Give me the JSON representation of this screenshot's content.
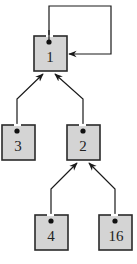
{
  "diagram": {
    "type": "union-find-tree",
    "colors": {
      "node_fill": "#d4d4d4",
      "node_stroke": "#2a2a2a",
      "edge": "#1a1a1a"
    },
    "nodes": [
      {
        "id": "n1",
        "label": "1",
        "x": 34,
        "y": 36,
        "w": 33,
        "h": 35
      },
      {
        "id": "n3",
        "label": "3",
        "x": 2,
        "y": 125,
        "w": 33,
        "h": 35
      },
      {
        "id": "n2",
        "label": "2",
        "x": 67,
        "y": 125,
        "w": 33,
        "h": 35
      },
      {
        "id": "n4",
        "label": "4",
        "x": 35,
        "y": 215,
        "w": 33,
        "h": 35
      },
      {
        "id": "n16",
        "label": "16",
        "x": 99,
        "y": 215,
        "w": 33,
        "h": 35
      }
    ],
    "edges": [
      {
        "from": "1",
        "to": "1",
        "kind": "self-loop"
      },
      {
        "from": "3",
        "to": "1"
      },
      {
        "from": "2",
        "to": "1"
      },
      {
        "from": "4",
        "to": "2"
      },
      {
        "from": "16",
        "to": "2"
      }
    ]
  }
}
